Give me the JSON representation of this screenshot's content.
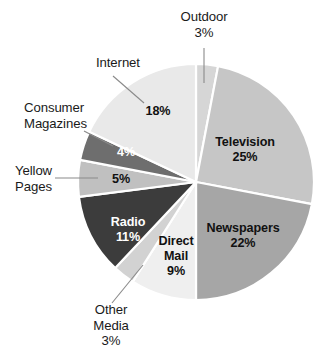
{
  "chart_data": {
    "type": "pie",
    "title": "",
    "subtitle": "",
    "xlabel": "",
    "ylabel": "",
    "legend_position": "none",
    "grid": false,
    "unit": "%",
    "total": 100,
    "categories": [
      "Outdoor",
      "Television",
      "Newspapers",
      "Direct Mail",
      "Other Media",
      "Radio",
      "Yellow Pages",
      "Consumer Magazines",
      "Internet"
    ],
    "values": [
      3,
      25,
      22,
      9,
      3,
      11,
      5,
      4,
      18
    ],
    "slices": [
      {
        "name": "Outdoor",
        "value": 3,
        "value_text": "3%",
        "color": "#d6d6d6",
        "label_placement": "outside",
        "label_text_color": "#1a1a1a",
        "leader": true
      },
      {
        "name": "Television",
        "value": 25,
        "value_text": "25%",
        "color": "#c6c6c6",
        "label_placement": "inside",
        "label_text_color": "#111111",
        "leader": false
      },
      {
        "name": "Newspapers",
        "value": 22,
        "value_text": "22%",
        "color": "#a6a6a6",
        "label_placement": "inside",
        "label_text_color": "#111111",
        "leader": false
      },
      {
        "name": "Direct Mail",
        "value": 9,
        "value_text": "9%",
        "color": "#efefef",
        "label_placement": "inside",
        "label_text_color": "#111111",
        "leader": false
      },
      {
        "name": "Other Media",
        "value": 3,
        "value_text": "3%",
        "color": "#d2d2d2",
        "label_placement": "outside",
        "label_text_color": "#1a1a1a",
        "leader": true
      },
      {
        "name": "Radio",
        "value": 11,
        "value_text": "11%",
        "color": "#3c3c3c",
        "label_placement": "inside",
        "label_text_color": "#ffffff",
        "leader": false
      },
      {
        "name": "Yellow Pages",
        "value": 5,
        "value_text": "5%",
        "color": "#c0c0c0",
        "label_placement": "split",
        "label_text_color": "#111111",
        "leader": true
      },
      {
        "name": "Consumer Magazines",
        "value": 4,
        "value_text": "4%",
        "color": "#6e6e6e",
        "label_placement": "split",
        "label_text_color": "#ffffff",
        "leader": true
      },
      {
        "name": "Internet",
        "value": 18,
        "value_text": "18%",
        "color": "#e9e9e9",
        "label_placement": "split",
        "label_text_color": "#111111",
        "leader": true
      }
    ]
  },
  "external_labels": {
    "outdoor": {
      "name": "Outdoor",
      "value_text": "3%"
    },
    "internet": {
      "name": "Internet"
    },
    "consumer_magazines": {
      "name_line1": "Consumer",
      "name_line2": "Magazines"
    },
    "yellow_pages": {
      "name_line1": "Yellow",
      "name_line2": "Pages"
    },
    "other_media": {
      "name_line1": "Other",
      "name_line2": "Media",
      "value_text": "3%"
    }
  },
  "inside_labels": {
    "television_name": "Television",
    "television_value": "25%",
    "newspapers_name": "Newspapers",
    "newspapers_value": "22%",
    "direct_mail_line1": "Direct",
    "direct_mail_line2": "Mail",
    "direct_mail_value": "9%",
    "radio_name": "Radio",
    "radio_value": "11%",
    "yellow_pages_value": "5%",
    "consumer_magazines_value": "4%",
    "internet_value": "18%"
  },
  "style": {
    "background": "#ffffff",
    "slice_separator": "#ffffff",
    "leader_line": "#8a8a8a"
  }
}
